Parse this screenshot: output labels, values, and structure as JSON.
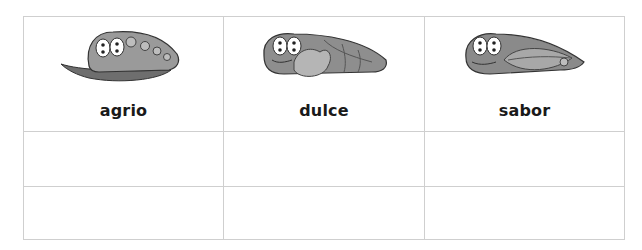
{
  "table": {
    "columns": [
      {
        "label": "agrio",
        "image": "caterpillar-on-chili-pepper"
      },
      {
        "label": "dulce",
        "image": "caterpillar-with-candy"
      },
      {
        "label": "sabor",
        "image": "caterpillar-with-leaf"
      }
    ],
    "rows": [
      [
        "",
        "",
        ""
      ],
      [
        "",
        "",
        ""
      ]
    ]
  }
}
